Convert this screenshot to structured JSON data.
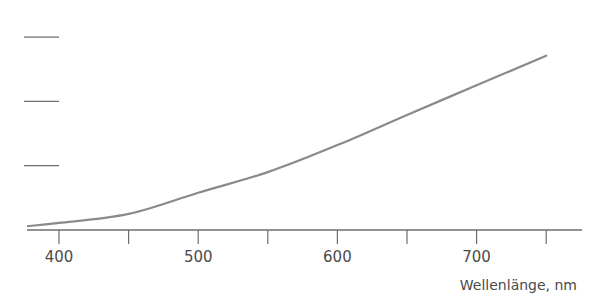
{
  "chart_data": {
    "type": "line",
    "title": "",
    "xlabel": "Wellenlänge, nm",
    "ylabel": "",
    "xlim": [
      380,
      790
    ],
    "ylim": [
      0,
      3
    ],
    "x_ticks_major": [
      400,
      500,
      600,
      700
    ],
    "x_ticks_minor": [
      450,
      550,
      650,
      750
    ],
    "x_tick_labels": [
      "400",
      "500",
      "600",
      "700"
    ],
    "y_ticks": [
      1,
      2,
      3
    ],
    "y_tick_labels": [
      "",
      "",
      ""
    ],
    "grid": false,
    "legend": null,
    "series": [
      {
        "name": "curve",
        "color": "#8a8a8a",
        "x": [
          380,
          400,
          450,
          500,
          550,
          600,
          650,
          700,
          750
        ],
        "y": [
          0.06,
          0.11,
          0.25,
          0.58,
          0.9,
          1.32,
          1.79,
          2.25,
          2.71
        ]
      }
    ]
  },
  "colors": {
    "axis": "#6e6e6e",
    "curve": "#8a8a8a",
    "text": "#4a4a4a"
  }
}
